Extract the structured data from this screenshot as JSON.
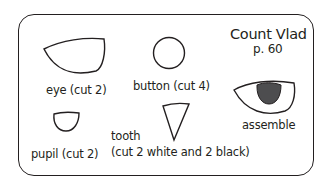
{
  "header": {
    "title": "Count Vlad",
    "page_ref": "p. 60"
  },
  "pieces": [
    {
      "name": "eye",
      "label": "eye (cut 2)"
    },
    {
      "name": "button",
      "label": "button (cut 4)"
    },
    {
      "name": "pupil",
      "label": "pupil (cut 2)"
    },
    {
      "name": "tooth",
      "label_line1": "tooth",
      "label_line2": "(cut 2 white and 2 black)"
    },
    {
      "name": "assemble",
      "label": "assemble"
    }
  ],
  "colors": {
    "outline": "#231f20",
    "pupil_fill": "#4d4d4f",
    "background": "#ffffff"
  }
}
